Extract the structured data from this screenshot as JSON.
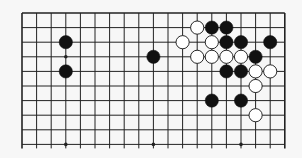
{
  "board": {
    "size": 19,
    "visible_rows": 10,
    "origin_x": 22,
    "origin_y": 13,
    "spacing": 14.6,
    "line_extension_bottom": 4,
    "background_color": "#f7f7f7",
    "line_color": "#222222",
    "star_points": [
      [
        3,
        3
      ],
      [
        9,
        3
      ],
      [
        15,
        3
      ],
      [
        3,
        9
      ],
      [
        9,
        9
      ],
      [
        15,
        9
      ]
    ],
    "stones": [
      {
        "color": "black",
        "col": 3,
        "row": 2
      },
      {
        "color": "black",
        "col": 3,
        "row": 4
      },
      {
        "color": "black",
        "col": 9,
        "row": 3
      },
      {
        "color": "white",
        "col": 12,
        "row": 1
      },
      {
        "color": "black",
        "col": 13,
        "row": 1
      },
      {
        "color": "black",
        "col": 14,
        "row": 1
      },
      {
        "color": "white",
        "col": 11,
        "row": 2
      },
      {
        "color": "white",
        "col": 13,
        "row": 2
      },
      {
        "color": "black",
        "col": 14,
        "row": 2
      },
      {
        "color": "black",
        "col": 15,
        "row": 2
      },
      {
        "color": "black",
        "col": 17,
        "row": 2
      },
      {
        "color": "white",
        "col": 12,
        "row": 3
      },
      {
        "color": "white",
        "col": 13,
        "row": 3
      },
      {
        "color": "white",
        "col": 14,
        "row": 3
      },
      {
        "color": "white",
        "col": 15,
        "row": 3
      },
      {
        "color": "black",
        "col": 16,
        "row": 3
      },
      {
        "color": "black",
        "col": 14,
        "row": 4
      },
      {
        "color": "black",
        "col": 15,
        "row": 4
      },
      {
        "color": "white",
        "col": 16,
        "row": 4
      },
      {
        "color": "white",
        "col": 17,
        "row": 4
      },
      {
        "color": "white",
        "col": 16,
        "row": 5
      },
      {
        "color": "black",
        "col": 13,
        "row": 6
      },
      {
        "color": "black",
        "col": 15,
        "row": 6
      },
      {
        "color": "white",
        "col": 16,
        "row": 7
      }
    ]
  }
}
